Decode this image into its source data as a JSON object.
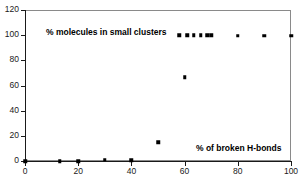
{
  "chart_data": {
    "type": "scatter",
    "title": "",
    "xlabel": "% of broken H-bonds",
    "ylabel": "% molecules in small clusters",
    "xlim": [
      0,
      100
    ],
    "ylim": [
      0,
      120
    ],
    "xticks": [
      0,
      20,
      40,
      60,
      80,
      100
    ],
    "yticks": [
      0,
      20,
      40,
      60,
      80,
      100,
      120
    ],
    "grid": false,
    "legend": "none",
    "marker": "filled-square",
    "marker_color": "#000000",
    "series": [
      {
        "name": "% molecules in small clusters",
        "x": [
          0,
          13,
          20,
          30,
          40,
          50,
          60,
          58,
          61,
          63.5,
          66,
          68.5,
          70,
          80,
          90,
          100
        ],
        "y": [
          0,
          0,
          0,
          0.8,
          0.5,
          15,
          66.5,
          100,
          100,
          100,
          100,
          100,
          100,
          99.5,
          99.5,
          99.5
        ]
      }
    ],
    "points": [
      {
        "x": 0,
        "y": 0
      },
      {
        "x": 13,
        "y": 0
      },
      {
        "x": 20,
        "y": 0
      },
      {
        "x": 30,
        "y": 0.8
      },
      {
        "x": 40,
        "y": 0.5
      },
      {
        "x": 50,
        "y": 15
      },
      {
        "x": 60,
        "y": 66.5
      },
      {
        "x": 58,
        "y": 100
      },
      {
        "x": 61,
        "y": 100
      },
      {
        "x": 63.5,
        "y": 100
      },
      {
        "x": 66,
        "y": 100
      },
      {
        "x": 68.5,
        "y": 100
      },
      {
        "x": 70,
        "y": 100
      },
      {
        "x": 80,
        "y": 99.5
      },
      {
        "x": 90,
        "y": 99.5
      },
      {
        "x": 100,
        "y": 99.5
      }
    ],
    "annotations": [
      {
        "text": "% molecules in small clusters",
        "x": 18,
        "y": 108
      },
      {
        "text": "% of broken H-bonds",
        "x": 65,
        "y": 10
      }
    ]
  },
  "axes": {
    "y_tick_labels": [
      "0",
      "20",
      "40",
      "60",
      "80",
      "100",
      "120"
    ],
    "x_tick_labels": [
      "0",
      "20",
      "40",
      "60",
      "80",
      "100"
    ]
  },
  "labels": {
    "series_label": "% molecules in small clusters",
    "xaxis_label": "% of broken H-bonds"
  },
  "colors": {
    "marker": "#000000",
    "axis": "#1a1a1a",
    "frame": "#8a8a8a",
    "background": "#ffffff"
  }
}
